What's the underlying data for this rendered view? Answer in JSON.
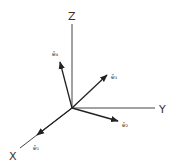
{
  "diagram": {
    "title": "",
    "origin": [
      72,
      108
    ],
    "axes": [
      {
        "name": "Z",
        "label": "Z",
        "end": [
          72,
          24
        ],
        "label_pos": [
          68,
          20
        ]
      },
      {
        "name": "Y",
        "label": "Y",
        "end": [
          155,
          108
        ],
        "label_pos": [
          159,
          113
        ]
      },
      {
        "name": "X",
        "label": "X",
        "end": [
          20,
          148
        ],
        "label_pos": [
          9,
          160
        ]
      }
    ],
    "vectors": [
      {
        "name": "e1",
        "label": "ē₁",
        "end": [
          37,
          135
        ],
        "label_pos": [
          33,
          150
        ]
      },
      {
        "name": "e2",
        "label": "ē₂",
        "end": [
          118,
          121
        ],
        "label_pos": [
          122,
          127
        ]
      },
      {
        "name": "e3",
        "label": "ē₃",
        "end": [
          107,
          75
        ],
        "label_pos": [
          111,
          79
        ]
      },
      {
        "name": "e4",
        "label": "ē₄",
        "end": [
          60,
          62
        ],
        "label_pos": [
          52,
          56
        ]
      }
    ],
    "colors": {
      "line": "#333333",
      "background": "#ffffff"
    }
  }
}
